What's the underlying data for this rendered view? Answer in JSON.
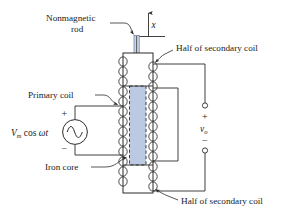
{
  "figure": {
    "labels": {
      "nonmagnetic_rod_line1": "Nonmagnetic",
      "nonmagnetic_rod_line2": "rod",
      "primary_coil": "Primary coil",
      "iron_core": "Iron core",
      "half_secondary_top": "Half of secondary coil",
      "half_secondary_bottom": "Half of secondary coil",
      "displacement_axis": "x",
      "source_v": "V",
      "source_v_sub": "m",
      "source_expr": " cos ",
      "source_omega_t": "ωt",
      "output_v": "v",
      "output_v_sub": "o",
      "plus_source": "+",
      "minus_source": "−",
      "plus_output": "+",
      "minus_output": "−"
    },
    "colors": {
      "core_fill": "#b7c7e0",
      "rod_fill": "#c9d5e8",
      "ink": "#2b2b2b",
      "background": "#ffffff"
    },
    "geometry": {
      "coil_loops_left": 13,
      "coil_loops_right": 13,
      "body_x": 123,
      "body_y": 53,
      "body_w": 30,
      "body_h": 140
    }
  }
}
